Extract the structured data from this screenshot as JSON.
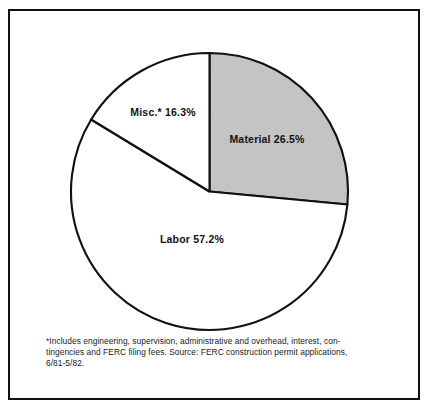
{
  "figure": {
    "frame_border_color": "#111111",
    "background_color": "#ffffff"
  },
  "chart_data": {
    "type": "pie",
    "title": "",
    "subtitle": "",
    "xlabel": "",
    "ylabel": "",
    "legend_position": "none",
    "grid": false,
    "start_angle_deg": 0,
    "direction": "clockwise",
    "categories": [
      "Material",
      "Labor",
      "Misc.*"
    ],
    "values": [
      26.5,
      57.2,
      16.3
    ],
    "units": "percent",
    "slices": [
      {
        "name": "Material",
        "label": "Material 26.5%",
        "value": 26.5,
        "color": "#c4c4c4",
        "start_deg": 0,
        "end_deg": 95.4
      },
      {
        "name": "Labor",
        "label": "Labor 57.2%",
        "value": 57.2,
        "color": "#ffffff",
        "start_deg": 95.4,
        "end_deg": 301.3
      },
      {
        "name": "Misc.",
        "label": "Misc.* 16.3%",
        "value": 16.3,
        "color": "#ffffff",
        "start_deg": 301.3,
        "end_deg": 360
      }
    ],
    "annotations": [
      "*Includes engineering, supervision, administrative and overhead, interest, con-",
      "tingencies and FERC filing fees. Source: FERC construction permit applications,",
      "6/81-5/82."
    ]
  },
  "footnote": {
    "line1": "*Includes engineering, supervision, administrative and overhead, interest, con-",
    "line2": "tingencies and FERC filing fees. Source: FERC construction permit applications,",
    "line3": "6/81-5/82."
  }
}
